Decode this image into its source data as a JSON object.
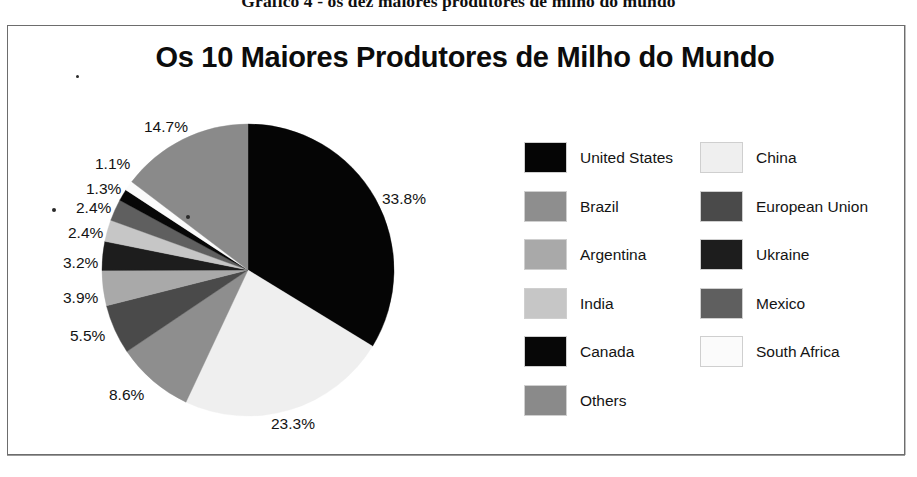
{
  "figure": {
    "caption": "Gráfico 4 - os dez maiores produtores de milho do mundo"
  },
  "chart_data": {
    "type": "pie",
    "title": "Os 10 Maiores Produtores de Milho do Mundo",
    "xlabel": "",
    "ylabel": "",
    "units": "percent",
    "legend_position": "right",
    "start_angle_deg": 0,
    "direction": "clockwise",
    "categories": [
      "United States",
      "China",
      "Brazil",
      "European Union",
      "Argentina",
      "Ukraine",
      "India",
      "Mexico",
      "Canada",
      "South Africa",
      "Others"
    ],
    "values": [
      33.8,
      23.3,
      8.6,
      5.5,
      3.9,
      3.2,
      2.4,
      2.4,
      1.3,
      1.1,
      14.7
    ],
    "value_labels": [
      "33.8%",
      "23.3%",
      "8.6%",
      "5.5%",
      "3.9%",
      "3.2%",
      "2.4%",
      "2.4%",
      "1.3%",
      "1.1%",
      "14.7%"
    ],
    "colors": [
      "#050505",
      "#efefef",
      "#8e8e8e",
      "#4a4a4a",
      "#a9a9a9",
      "#1d1d1d",
      "#c6c6c6",
      "#5f5f5f",
      "#070707",
      "#fbfbfb",
      "#8a8a8a"
    ],
    "slices": [
      {
        "label": "United States",
        "value": 33.8,
        "value_label": "33.8%",
        "color": "#050505"
      },
      {
        "label": "China",
        "value": 23.3,
        "value_label": "23.3%",
        "color": "#efefef"
      },
      {
        "label": "Brazil",
        "value": 8.6,
        "value_label": "8.6%",
        "color": "#8e8e8e"
      },
      {
        "label": "European Union",
        "value": 5.5,
        "value_label": "5.5%",
        "color": "#4a4a4a"
      },
      {
        "label": "Argentina",
        "value": 3.9,
        "value_label": "3.9%",
        "color": "#a9a9a9"
      },
      {
        "label": "Ukraine",
        "value": 3.2,
        "value_label": "3.2%",
        "color": "#1d1d1d"
      },
      {
        "label": "India",
        "value": 2.4,
        "value_label": "2.4%",
        "color": "#c6c6c6"
      },
      {
        "label": "Mexico",
        "value": 2.4,
        "value_label": "2.4%",
        "color": "#5f5f5f"
      },
      {
        "label": "Canada",
        "value": 1.3,
        "value_label": "1.3%",
        "color": "#070707"
      },
      {
        "label": "South Africa",
        "value": 1.1,
        "value_label": "1.1%",
        "color": "#fbfbfb"
      },
      {
        "label": "Others",
        "value": 14.7,
        "value_label": "14.7%",
        "color": "#8a8a8a"
      }
    ]
  },
  "legend": {
    "left_column": [
      {
        "label": "United States",
        "color": "#050505"
      },
      {
        "label": "Brazil",
        "color": "#8e8e8e"
      },
      {
        "label": "Argentina",
        "color": "#a9a9a9"
      },
      {
        "label": "India",
        "color": "#c6c6c6"
      },
      {
        "label": "Canada",
        "color": "#070707"
      },
      {
        "label": "Others",
        "color": "#8a8a8a"
      }
    ],
    "right_column": [
      {
        "label": "China",
        "color": "#efefef"
      },
      {
        "label": "European Union",
        "color": "#4a4a4a"
      },
      {
        "label": "Ukraine",
        "color": "#1d1d1d"
      },
      {
        "label": "Mexico",
        "color": "#5f5f5f"
      },
      {
        "label": "South Africa",
        "color": "#fbfbfb"
      }
    ]
  },
  "pct_labels": [
    {
      "text": "14.7%",
      "x": 144,
      "y": 118
    },
    {
      "text": "1.1%",
      "x": 95,
      "y": 155
    },
    {
      "text": "1.3%",
      "x": 86,
      "y": 180
    },
    {
      "text": "2.4%",
      "x": 76,
      "y": 199
    },
    {
      "text": "2.4%",
      "x": 68,
      "y": 224
    },
    {
      "text": "3.2%",
      "x": 63,
      "y": 254
    },
    {
      "text": "3.9%",
      "x": 63,
      "y": 289
    },
    {
      "text": "5.5%",
      "x": 70,
      "y": 327
    },
    {
      "text": "8.6%",
      "x": 109,
      "y": 386
    },
    {
      "text": "23.3%",
      "x": 271,
      "y": 415
    },
    {
      "text": "33.8%",
      "x": 382,
      "y": 190
    }
  ],
  "pie_geometry": {
    "cx": 248,
    "cy": 270,
    "r": 146
  }
}
